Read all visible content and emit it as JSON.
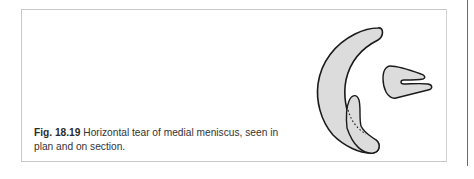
{
  "figure": {
    "label": "Fig. 18.19",
    "caption_line1": "Horizontal tear of medial meniscus, seen in",
    "caption_line2": "plan and on section.",
    "illustration": {
      "subject": "medial meniscus",
      "views": [
        "plan",
        "section"
      ],
      "fill_color": "#dcdcdc",
      "stroke_color": "#1a1a1a"
    }
  }
}
